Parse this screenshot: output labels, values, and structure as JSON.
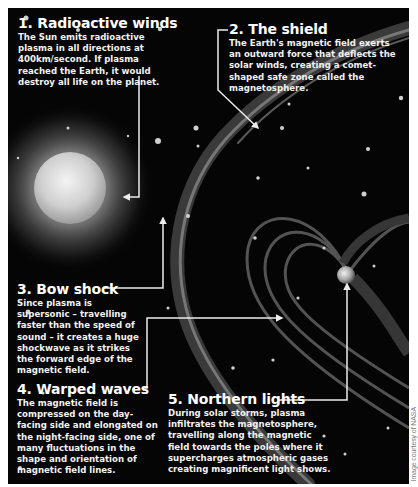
{
  "infographic": {
    "theme_colors": {
      "background": "#050505",
      "text": "#ffffff",
      "lines": "#e8e8e8",
      "page": "#ffffff"
    },
    "callouts": [
      {
        "number": "1.",
        "heading": "1. Radioactive winds",
        "body": "The Sun emits radioactive plasma in all directions at 400km/second. If plasma reached the Earth, it would destroy all life on the planet."
      },
      {
        "number": "2.",
        "heading": "2. The shield",
        "body": "The Earth's magnetic field exerts an outward force that deflects the solar winds, creating a comet-shaped safe zone called the magnetosphere."
      },
      {
        "number": "3.",
        "heading": "3. Bow shock",
        "body": "Since plasma is supersonic – travelling faster than the speed of sound – it creates a huge shockwave as it strikes the forward edge of the magnetic field."
      },
      {
        "number": "4.",
        "heading": "4. Warped waves",
        "body": "The magnetic field is compressed on the day-facing side and elongated on the night-facing side, one of many fluctuations in the shape and orientation of magnetic field lines."
      },
      {
        "number": "5.",
        "heading": "5. Northern lights",
        "body": "During solar storms, plasma infiltrates the magnetosphere, travelling along the magnetic field towards the poles where it supercharges atmospheric gases creating magnificent light shows."
      }
    ],
    "illustration": {
      "objects": [
        "sun",
        "earth",
        "bow-shock",
        "magnetic-field-lines",
        "stars"
      ]
    },
    "credit": "Image courtesy of NASA"
  }
}
